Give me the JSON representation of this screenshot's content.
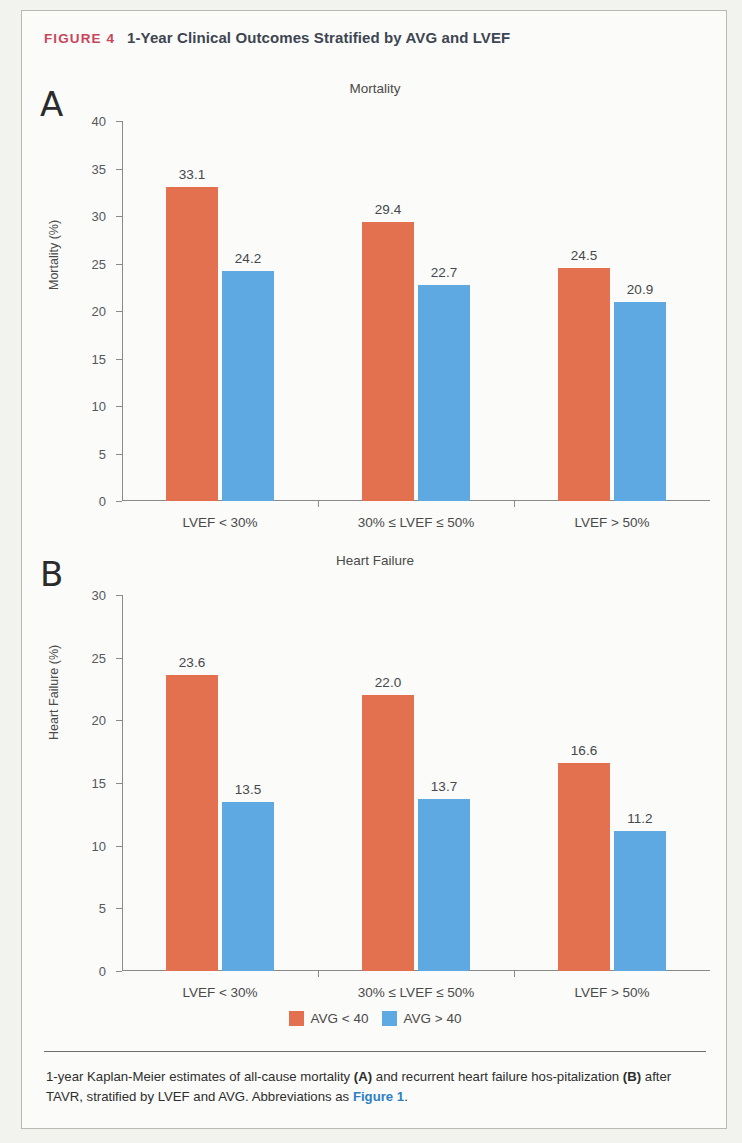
{
  "figure": {
    "tag": "FIGURE 4",
    "title": "1-Year Clinical Outcomes Stratified by AVG and LVEF",
    "tag_color": "#c9455b"
  },
  "legend": {
    "items": [
      {
        "label": "AVG < 40",
        "color": "#e3704f"
      },
      {
        "label": "AVG > 40",
        "color": "#5fa9e2"
      }
    ]
  },
  "caption": {
    "part1": "1-year Kaplan-Meier estimates of all-cause mortality ",
    "boldA": "(A)",
    "part2": " and recurrent heart failure hos-pitalization ",
    "boldB": "(B)",
    "part3": " after TAVR, stratified by LVEF and AVG. Abbreviations as ",
    "link": "Figure 1",
    "part4": "."
  },
  "chart_data": [
    {
      "type": "bar",
      "panel": "A",
      "title": "Mortality",
      "xlabel": "",
      "ylabel": "Mortality (%)",
      "ylim": [
        0,
        40
      ],
      "yticks": [
        0,
        5,
        10,
        15,
        20,
        25,
        30,
        35,
        40
      ],
      "grid": false,
      "legend_position": "bottom",
      "categories": [
        "LVEF < 30%",
        "30% ≤ LVEF ≤ 50%",
        "LVEF > 50%"
      ],
      "series": [
        {
          "name": "AVG < 40",
          "color": "#e3704f",
          "values": [
            33.1,
            29.4,
            24.5
          ],
          "labels": [
            "33.1",
            "29.4",
            "24.5"
          ]
        },
        {
          "name": "AVG > 40",
          "color": "#5fa9e2",
          "values": [
            24.2,
            22.7,
            20.9
          ],
          "labels": [
            "24.2",
            "22.7",
            "20.9"
          ]
        }
      ]
    },
    {
      "type": "bar",
      "panel": "B",
      "title": "Heart Failure",
      "xlabel": "",
      "ylabel": "Heart Failure (%)",
      "ylim": [
        0,
        30
      ],
      "yticks": [
        0,
        5,
        10,
        15,
        20,
        25,
        30
      ],
      "grid": false,
      "legend_position": "bottom",
      "categories": [
        "LVEF < 30%",
        "30% ≤ LVEF ≤ 50%",
        "LVEF > 50%"
      ],
      "series": [
        {
          "name": "AVG < 40",
          "color": "#e3704f",
          "values": [
            23.6,
            22.0,
            16.6
          ],
          "labels": [
            "23.6",
            "22.0",
            "16.6"
          ]
        },
        {
          "name": "AVG > 40",
          "color": "#5fa9e2",
          "values": [
            13.5,
            13.7,
            11.2
          ],
          "labels": [
            "13.5",
            "13.7",
            "11.2"
          ]
        }
      ]
    }
  ]
}
